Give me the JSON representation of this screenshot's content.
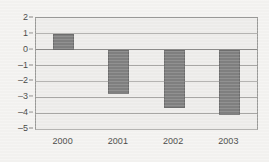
{
  "chart_data": {
    "type": "bar",
    "title": "",
    "subtitle": "",
    "xlabel": "",
    "ylabel": "",
    "categories": [
      "2000",
      "2001",
      "2002",
      "2003"
    ],
    "values": [
      1.0,
      -2.8,
      -3.65,
      -4.1
    ],
    "series": [
      {
        "name": "",
        "values": [
          1.0,
          -2.8,
          -3.65,
          -4.1
        ]
      }
    ],
    "ylim": [
      -5,
      2
    ],
    "ytick_labels": [
      "2",
      "1",
      "0",
      "–1",
      "–2",
      "–3",
      "–4",
      "–5"
    ],
    "ytick_values": [
      2,
      1,
      0,
      -1,
      -2,
      -3,
      -4,
      -5
    ],
    "xtick_labels": [
      "2000",
      "2001",
      "2002",
      "2003"
    ],
    "grid": true,
    "grid_axis": "y",
    "legend": false,
    "legend_position": "none",
    "annotations": [],
    "colors": {
      "bar_fill": "#808080",
      "bar_stroke": "#6e6e6e",
      "plot_background": "#eeedeb",
      "page_background": "#f4f3f1",
      "gridline": "#a9a8a6",
      "zero_line": "#8d8c8a",
      "axis_text": "#4a4a48",
      "plot_border": "#9a9a98"
    }
  }
}
